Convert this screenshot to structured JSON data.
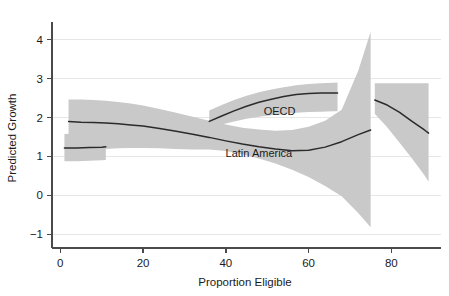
{
  "chart_data": {
    "type": "line",
    "title": "",
    "subtitle": "",
    "xlabel": "Proportion Eligible",
    "ylabel": "Predicted Growth",
    "xlim": [
      -2,
      92
    ],
    "ylim": [
      -1.35,
      4.35
    ],
    "xticks": [
      0,
      20,
      40,
      60,
      80
    ],
    "xtick_labels": [
      "0",
      "20",
      "40",
      "60",
      "80"
    ],
    "yticks": [
      -1,
      0,
      1,
      2,
      3,
      4
    ],
    "ytick_labels": [
      "−1",
      "0",
      "1",
      "2",
      "3",
      "4"
    ],
    "grid": "horizontal",
    "legend_position": "inline-annotations",
    "band_color": "#c9c9c9",
    "line_color": "#2b2b2b",
    "grid_color": "#e6e6e6",
    "axis_color": "#4a4a4a",
    "background": "#ffffff",
    "annotations": [
      {
        "text": "OECD",
        "x": 53,
        "y": 2.06
      },
      {
        "text": "Latin America",
        "x": 48,
        "y": 0.98
      }
    ],
    "series": [
      {
        "name": "Latin America",
        "label": "Latin America",
        "description": "Lowess fit with 95% confidence band; declines from ~1.9 to a trough of ~1.15 near 57% eligible, then rises to ~1.68 near 75%.",
        "x": [
          2,
          5,
          8,
          11,
          14,
          17,
          20,
          24,
          28,
          32,
          36,
          40,
          44,
          48,
          52,
          56,
          60,
          64,
          68,
          72,
          75
        ],
        "y": [
          1.9,
          1.88,
          1.87,
          1.86,
          1.84,
          1.81,
          1.78,
          1.72,
          1.65,
          1.57,
          1.49,
          1.4,
          1.32,
          1.25,
          1.19,
          1.15,
          1.16,
          1.24,
          1.38,
          1.56,
          1.68
        ],
        "ci_low": [
          1.1,
          1.13,
          1.16,
          1.19,
          1.21,
          1.22,
          1.22,
          1.21,
          1.19,
          1.18,
          1.18,
          1.14,
          1.06,
          0.95,
          0.82,
          0.66,
          0.47,
          0.24,
          -0.02,
          -0.45,
          -0.82
        ],
        "ci_high": [
          2.46,
          2.46,
          2.45,
          2.43,
          2.4,
          2.36,
          2.31,
          2.22,
          2.12,
          2.02,
          1.92,
          1.82,
          1.74,
          1.69,
          1.66,
          1.68,
          1.76,
          1.92,
          2.2,
          3.2,
          4.2
        ]
      },
      {
        "name": "OECD",
        "label": "OECD",
        "description": "Lowess fit with 95% confidence band; short flat stub near ~1.22 at low eligibility, rising branch from ~1.9 at 36% to a plateau of ~2.63 at 67%, then a descending branch from ~2.45 at 76% to ~1.60 at 89%.",
        "segments": [
          {
            "x": [
              1,
              4,
              7,
              10,
              11
            ],
            "y": [
              1.22,
              1.22,
              1.23,
              1.24,
              1.25
            ],
            "ci_low": [
              0.88,
              0.88,
              0.89,
              0.9,
              0.91
            ],
            "ci_high": [
              1.58,
              1.59,
              1.61,
              1.63,
              1.64
            ]
          },
          {
            "x": [
              36,
              39,
              42,
              45,
              48,
              51,
              54,
              57,
              60,
              63,
              66,
              67
            ],
            "y": [
              1.9,
              2.04,
              2.17,
              2.29,
              2.39,
              2.47,
              2.54,
              2.59,
              2.62,
              2.63,
              2.63,
              2.63
            ],
            "ci_low": [
              1.72,
              1.82,
              1.9,
              1.97,
              2.02,
              2.06,
              2.09,
              2.12,
              2.14,
              2.15,
              2.16,
              2.16
            ],
            "ci_high": [
              2.18,
              2.32,
              2.45,
              2.56,
              2.65,
              2.72,
              2.78,
              2.83,
              2.86,
              2.88,
              2.89,
              2.9
            ]
          },
          {
            "x": [
              76,
              79,
              82,
              85,
              88,
              89
            ],
            "y": [
              2.45,
              2.32,
              2.13,
              1.9,
              1.68,
              1.6
            ],
            "ci_low": [
              2.1,
              1.75,
              1.35,
              0.95,
              0.52,
              0.35
            ],
            "ci_high": [
              2.88,
              2.88,
              2.88,
              2.88,
              2.88,
              2.88
            ]
          }
        ]
      }
    ]
  }
}
